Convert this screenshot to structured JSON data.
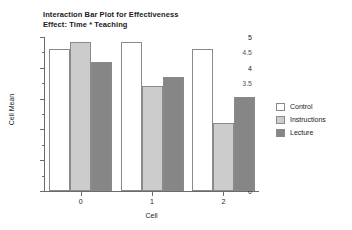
{
  "chart_data": {
    "type": "bar",
    "title": "Interaction Bar Plot for Effectiveness",
    "subtitle": "Effect: Time * Teaching",
    "xlabel": "Cell",
    "ylabel": "Cell Mean",
    "categories": [
      "0",
      "1",
      "2"
    ],
    "ylim": [
      0,
      5
    ],
    "ytick_values": [
      0,
      0.5,
      1,
      1.5,
      2,
      2.5,
      3,
      3.5,
      4,
      4.5,
      5
    ],
    "ytick_labels": [
      "0",
      ".5",
      "1",
      "1.5",
      "2",
      "2.5",
      "3",
      "3.5",
      "4",
      "4.5",
      "5"
    ],
    "grid": false,
    "legend_position": "right",
    "series": [
      {
        "name": "Control",
        "color": "#ffffff",
        "values": [
          4.6,
          4.85,
          4.6
        ]
      },
      {
        "name": "Instructions",
        "color": "#cccccc",
        "values": [
          4.85,
          3.4,
          2.2
        ]
      },
      {
        "name": "Lecture",
        "color": "#868686",
        "values": [
          4.2,
          3.7,
          3.05
        ]
      }
    ]
  }
}
